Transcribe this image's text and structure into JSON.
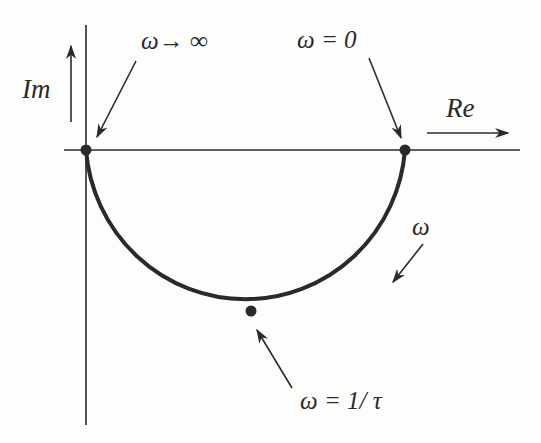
{
  "diagram": {
    "type": "nyquist-plot",
    "colors": {
      "ink": "#2a2a2a",
      "background": "#fdfdfb"
    },
    "axes": {
      "real_label": "Re",
      "imag_label": "Im"
    },
    "labels": {
      "omega_infinity": "ω→ ∞",
      "omega_zero": "ω = 0",
      "omega_direction": "ω",
      "omega_corner": "ω = 1/ τ"
    },
    "points": [
      {
        "name": "origin",
        "meaning": "ω→∞"
      },
      {
        "name": "real-axis-intercept",
        "meaning": "ω = 0"
      },
      {
        "name": "semicircle-bottom",
        "meaning": "ω = 1/τ"
      }
    ],
    "curve": {
      "shape": "lower semicircle",
      "from": "ω = 0",
      "to": "ω→∞"
    }
  }
}
